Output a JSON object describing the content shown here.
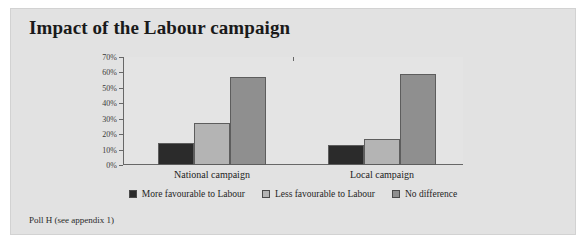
{
  "figure": {
    "title": "Impact of the Labour campaign",
    "footnote": "Poll H (see appendix 1)",
    "background_color": "#e2e2e2"
  },
  "chart_data": {
    "type": "bar",
    "title": "Impact of the Labour campaign",
    "xlabel": "",
    "ylabel": "",
    "categories": [
      "National campaign",
      "Local campaign"
    ],
    "series": [
      {
        "name": "More favourable to Labour",
        "color": "#2b2b2b",
        "values": [
          14,
          13
        ]
      },
      {
        "name": "Less favourable to Labour",
        "color": "#b4b4b4",
        "values": [
          27,
          17
        ]
      },
      {
        "name": "No difference",
        "color": "#8f8f8f",
        "values": [
          57,
          59
        ]
      }
    ],
    "ylim": [
      0,
      70
    ],
    "ytick_values": [
      0,
      10,
      20,
      30,
      40,
      50,
      60,
      70
    ],
    "ytick_labels": [
      "0%",
      "10%",
      "20%",
      "30%",
      "40%",
      "50%",
      "60%",
      "70%"
    ],
    "grid": false,
    "legend_position": "bottom"
  }
}
